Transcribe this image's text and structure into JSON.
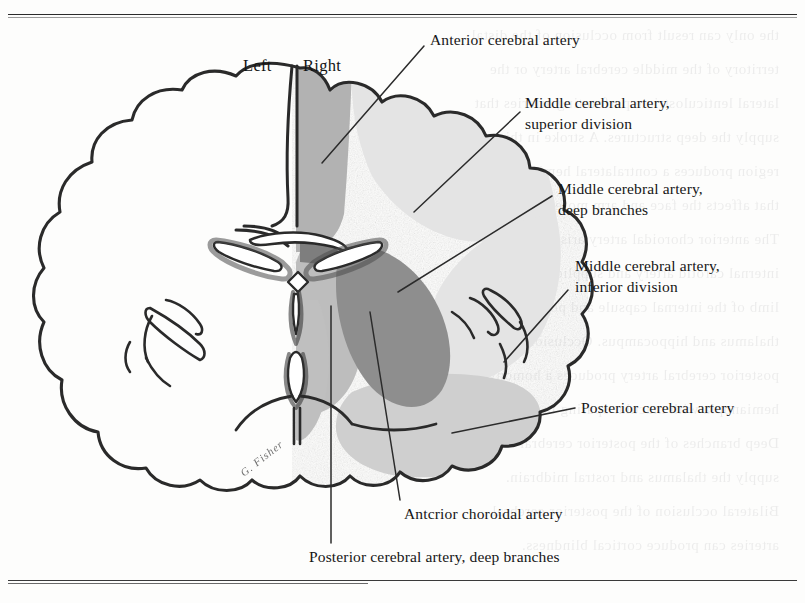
{
  "page": {
    "bleed_text": "the only can result from occlusion of the distal\nterritory of the middle cerebral artery or the\nlateral lenticulostriate perforating arteries that\nsupply the deep structures. A stroke in this\nregion produces a contralateral hemiparesis\nthat affects the face and arm more than the leg.\nThe anterior choroidal artery arises from the\ninternal carotid artery and supplies the posterior\nlimb of the internal capsule and portions of the\nthalamus and hippocampus. Occlusion of the\nposterior cerebral artery produces a homonymous\nhemianopia with macular sparing in many cases.\nDeep branches of the posterior cerebral artery\nsupply the thalamus and rostral midbrain.\nBilateral occlusion of the posterior cerebral\narteries can produce cortical blindness.",
    "top_rule": true,
    "bottom_rule": true
  },
  "figure": {
    "hemisphere_labels": [
      {
        "name": "left",
        "text": "Left",
        "x": 243,
        "y": 58
      },
      {
        "name": "right",
        "text": "Right",
        "x": 303,
        "y": 58
      }
    ],
    "artist_signature": "G. Fisher",
    "labels": [
      {
        "id": "anterior-cerebral-artery",
        "lines": [
          "Anterior cerebral artery"
        ],
        "x": 430,
        "y": 30,
        "leader": {
          "x1": 424,
          "y1": 46,
          "x2": 322,
          "y2": 163
        }
      },
      {
        "id": "mca-superior-division",
        "lines": [
          "Middle cerebral artery,",
          "superior division"
        ],
        "x": 525,
        "y": 92,
        "leader": {
          "x1": 520,
          "y1": 110,
          "x2": 414,
          "y2": 212
        }
      },
      {
        "id": "mca-deep-branches",
        "lines": [
          "Middle cerebral artery,",
          "deep branches"
        ],
        "x": 558,
        "y": 178,
        "leader": {
          "x1": 552,
          "y1": 195,
          "x2": 398,
          "y2": 292
        }
      },
      {
        "id": "mca-inferior-division",
        "lines": [
          "Middle cerebral artery,",
          "inferior division"
        ],
        "x": 575,
        "y": 255,
        "leader": {
          "x1": 568,
          "y1": 289,
          "x2": 504,
          "y2": 361
        }
      },
      {
        "id": "posterior-cerebral-artery",
        "lines": [
          "Posterior cerebral artery"
        ],
        "x": 580,
        "y": 398,
        "leader": {
          "x1": 575,
          "y1": 408,
          "x2": 452,
          "y2": 433
        }
      },
      {
        "id": "anterior-choroidal-artery",
        "lines": [
          "Antcrior choroidal artery"
        ],
        "x": 404,
        "y": 506,
        "leader": {
          "x1": 400,
          "y1": 503,
          "x2": 370,
          "y2": 313
        }
      },
      {
        "id": "posterior-cerebral-artery-deep-branches",
        "lines": [
          "Posterior cerebral artery, deep branches"
        ],
        "x": 309,
        "y": 549,
        "leader": {
          "x1": 331,
          "y1": 545,
          "x2": 331,
          "y2": 307
        }
      }
    ],
    "territories": [
      {
        "id": "aca-territory",
        "label": "Anterior cerebral artery",
        "shade": "#b2b2b2"
      },
      {
        "id": "mca-superior",
        "label": "Middle cerebral artery, superior division",
        "shade": "#e3e3e3"
      },
      {
        "id": "mca-deep",
        "label": "Middle cerebral artery, deep branches",
        "shade": "#8f8f8f"
      },
      {
        "id": "mca-inferior",
        "label": "Middle cerebral artery, inferior division",
        "shade": "#e3e3e3"
      },
      {
        "id": "pca-territory",
        "label": "Posterior cerebral artery",
        "shade": "#cfcfcf"
      },
      {
        "id": "pca-deep",
        "label": "Posterior cerebral artery, deep branches",
        "shade": "#bdbdbd"
      },
      {
        "id": "achoroidal-territory",
        "label": "Anterior choroidal artery",
        "shade": "#bdbdbd"
      }
    ],
    "colors": {
      "outline": "#2a2a2a",
      "paper": "#fdfdfc",
      "shade_dark": "#8f8f8f",
      "shade_mid": "#b2b2b2",
      "shade_light": "#e3e3e3",
      "shade_pale": "#cfcfcf",
      "leader": "#2b2b2b"
    }
  }
}
